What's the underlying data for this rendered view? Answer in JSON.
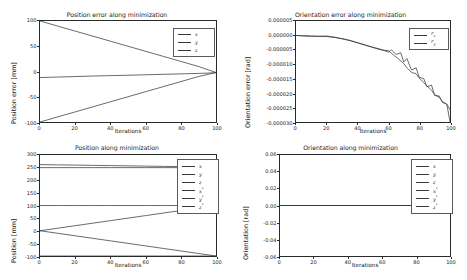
{
  "figure": {
    "width": 467,
    "height": 280,
    "background": "#ffffff",
    "line_color": "#3a3a3a",
    "axis_color": "#2a2a2a"
  },
  "panels": [
    {
      "key": "position_error",
      "title": "Position error along minimization",
      "xlabel": "Iterations",
      "ylabel": "Position error [mm]",
      "xticks": [
        "0",
        "20",
        "40",
        "60",
        "80",
        "100"
      ],
      "yticks": [
        "100",
        "50",
        "0",
        "-50",
        "-100"
      ],
      "legend": [
        {
          "label": "x",
          "sub": "",
          "sup": ""
        },
        {
          "label": "y",
          "sub": "",
          "sup": ""
        },
        {
          "label": "z",
          "sub": "",
          "sup": ""
        }
      ]
    },
    {
      "key": "orientation_error",
      "title": "Orientation error along minimization",
      "xlabel": "Iterations",
      "ylabel": "Orientation error [rad]",
      "xticks": [
        "0",
        "20",
        "40",
        "60",
        "80",
        "100"
      ],
      "yticks": [
        "0.000005",
        "0.000000",
        "-0.000005",
        "-0.000010",
        "-0.000015",
        "-0.000020",
        "-0.000025",
        "-0.000030"
      ],
      "legend": [
        {
          "label": "r",
          "sub": "x",
          "sup": ""
        },
        {
          "label": "r",
          "sub": "y",
          "sup": ""
        }
      ]
    },
    {
      "key": "position",
      "title": "Position along minimization",
      "xlabel": "Iterations",
      "ylabel": "Position  [mm]",
      "xticks": [
        "0",
        "20",
        "40",
        "60",
        "80",
        "100"
      ],
      "yticks": [
        "300",
        "250",
        "200",
        "150",
        "100",
        "50",
        "0",
        "-50",
        "-100"
      ],
      "legend": [
        {
          "label": "x",
          "sub": "",
          "sup": ""
        },
        {
          "label": "y",
          "sub": "",
          "sup": ""
        },
        {
          "label": "z",
          "sub": "",
          "sup": ""
        },
        {
          "label": "x",
          "sub": "",
          "sup": "*"
        },
        {
          "label": "y",
          "sub": "",
          "sup": "*"
        },
        {
          "label": "z",
          "sub": "",
          "sup": "*"
        }
      ]
    },
    {
      "key": "orientation",
      "title": "Orientation along minimization",
      "xlabel": "Iterations",
      "ylabel": "Orientation [rad]",
      "xticks": [
        "0",
        "20",
        "40",
        "60",
        "80",
        "100"
      ],
      "yticks": [
        "0.06",
        "0.04",
        "0.02",
        "0.00",
        "-0.02",
        "-0.04",
        "-0.06"
      ],
      "legend": [
        {
          "label": "x",
          "sub": "",
          "sup": ""
        },
        {
          "label": "y",
          "sub": "",
          "sup": ""
        },
        {
          "label": "z",
          "sub": "",
          "sup": ""
        },
        {
          "label": "x",
          "sub": "",
          "sup": "*"
        },
        {
          "label": "y",
          "sub": "",
          "sup": "*"
        },
        {
          "label": "z",
          "sub": "",
          "sup": "*"
        }
      ]
    }
  ],
  "chart_data": [
    {
      "type": "line",
      "key": "position_error",
      "title": "Position error along minimization",
      "xlabel": "Iterations",
      "ylabel": "Position error [mm]",
      "xlim": [
        0,
        100
      ],
      "ylim": [
        -100,
        100
      ],
      "grid": false,
      "legend_position": "upper right",
      "x": [
        0,
        10,
        20,
        30,
        40,
        50,
        60,
        70,
        80,
        90,
        100
      ],
      "series": [
        {
          "name": "x",
          "values": [
            100,
            90,
            80,
            70,
            60,
            50,
            40,
            30,
            20,
            10,
            -2
          ]
        },
        {
          "name": "y",
          "values": [
            -100,
            -90,
            -80,
            -70,
            -60,
            -50,
            -40,
            -30,
            -20,
            -10,
            -2
          ]
        },
        {
          "name": "z",
          "values": [
            -12,
            -11,
            -10,
            -9,
            -8.2,
            -7.4,
            -6.5,
            -5.6,
            -4.7,
            -3.8,
            -2.5
          ]
        }
      ]
    },
    {
      "type": "line",
      "key": "orientation_error",
      "title": "Orientation error along minimization",
      "xlabel": "Iterations",
      "ylabel": "Orientation error [rad]",
      "xlim": [
        0,
        100
      ],
      "ylim": [
        -3e-05,
        5e-06
      ],
      "grid": false,
      "legend_position": "upper right",
      "x": [
        0,
        5,
        10,
        15,
        20,
        25,
        30,
        35,
        40,
        45,
        50,
        55,
        60,
        62,
        65,
        68,
        70,
        72,
        75,
        78,
        80,
        83,
        85,
        88,
        90,
        93,
        95,
        98,
        100
      ],
      "series": [
        {
          "name": "r_x",
          "values": [
            0.0,
            -1e-07,
            -2e-07,
            -3e-07,
            -4e-07,
            -7e-07,
            -1.1e-06,
            -1.7e-06,
            -2.5e-06,
            -3.3e-06,
            -4.2e-06,
            -5e-06,
            -5.3e-06,
            -6.2e-06,
            -7.5e-06,
            -8.8e-06,
            -9.8e-06,
            -1.12e-05,
            -1.28e-05,
            -1.33e-05,
            -1.48e-05,
            -1.63e-05,
            -1.75e-05,
            -1.9e-05,
            -2.05e-05,
            -2.15e-05,
            -2.28e-05,
            -2.4e-05,
            -3e-05
          ]
        },
        {
          "name": "r_y",
          "values": [
            0.0,
            -2e-07,
            -3e-07,
            -3e-07,
            -2e-07,
            -6e-07,
            -1.2e-06,
            -1.8e-06,
            -2.6e-06,
            -3.4e-06,
            -4.1e-06,
            -4.8e-06,
            -5.8e-06,
            -5e-06,
            -6.6e-06,
            -6e-06,
            -9.2e-06,
            -8e-06,
            -1.2e-05,
            -1.12e-05,
            -1.45e-05,
            -1.5e-05,
            -1.78e-05,
            -1.72e-05,
            -2.08e-05,
            -2.1e-05,
            -2.32e-05,
            -2.38e-05,
            -2.58e-05
          ]
        }
      ]
    },
    {
      "type": "line",
      "key": "position",
      "title": "Position along minimization",
      "xlabel": "Iterations",
      "ylabel": "Position  [mm]",
      "xlim": [
        0,
        100
      ],
      "ylim": [
        -100,
        300
      ],
      "grid": false,
      "legend_position": "upper right",
      "x": [
        0,
        10,
        20,
        30,
        40,
        50,
        60,
        70,
        80,
        90,
        100
      ],
      "series": [
        {
          "name": "x",
          "values": [
            0,
            10,
            20,
            30,
            40,
            50,
            60,
            70,
            80,
            90,
            100
          ]
        },
        {
          "name": "y",
          "values": [
            0,
            -10,
            -20,
            -30,
            -40,
            -50,
            -60,
            -70,
            -80,
            -90,
            -100
          ]
        },
        {
          "name": "z",
          "values": [
            262,
            261,
            260,
            259,
            258,
            257,
            256,
            255,
            254,
            253,
            252
          ]
        },
        {
          "name": "x*",
          "values": [
            100,
            100,
            100,
            100,
            100,
            100,
            100,
            100,
            100,
            100,
            100
          ]
        },
        {
          "name": "y*",
          "values": [
            -100,
            -100,
            -100,
            -100,
            -100,
            -100,
            -100,
            -100,
            -100,
            -100,
            -100
          ]
        },
        {
          "name": "z*",
          "values": [
            250,
            250,
            250,
            250,
            250,
            250,
            250,
            250,
            250,
            250,
            250
          ]
        }
      ]
    },
    {
      "type": "line",
      "key": "orientation",
      "title": "Orientation along minimization",
      "xlabel": "Iterations",
      "ylabel": "Orientation [rad]",
      "xlim": [
        0,
        100
      ],
      "ylim": [
        -0.06,
        0.06
      ],
      "grid": false,
      "legend_position": "upper right",
      "x": [
        0,
        20,
        40,
        60,
        80,
        100
      ],
      "series": [
        {
          "name": "x",
          "values": [
            0,
            0,
            0,
            0,
            0,
            0
          ]
        },
        {
          "name": "y",
          "values": [
            0,
            0,
            0,
            0,
            0,
            0
          ]
        },
        {
          "name": "z",
          "values": [
            0,
            0,
            0,
            0,
            0,
            0
          ]
        },
        {
          "name": "x*",
          "values": [
            0,
            0,
            0,
            0,
            0,
            0
          ]
        },
        {
          "name": "y*",
          "values": [
            0,
            0,
            0,
            0,
            0,
            0
          ]
        },
        {
          "name": "z*",
          "values": [
            0,
            0,
            0,
            0,
            0,
            0
          ]
        }
      ]
    }
  ]
}
